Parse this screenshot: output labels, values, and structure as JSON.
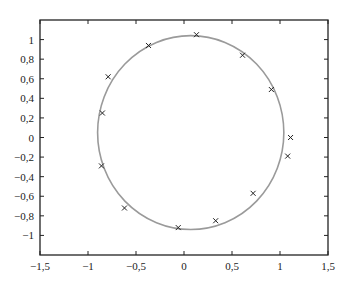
{
  "chart_data": {
    "type": "scatter",
    "title": "",
    "xlabel": "",
    "ylabel": "",
    "xlim": [
      -1.5,
      1.5
    ],
    "ylim": [
      -1.2,
      1.2
    ],
    "grid": false,
    "legend": null,
    "x_ticks": [
      -1.5,
      -1,
      -0.5,
      0,
      0.5,
      1,
      1.5
    ],
    "x_tick_labels": [
      "−1,5",
      "−1",
      "−0,5",
      "0",
      "0,5",
      "1",
      "1,5"
    ],
    "y_ticks": [
      -1,
      -0.8,
      -0.6,
      -0.4,
      -0.2,
      0,
      0.2,
      0.4,
      0.6,
      0.8,
      1
    ],
    "y_tick_labels": [
      "−1",
      "−0,8",
      "−0,6",
      "−0,4",
      "−0,2",
      "0",
      "0,2",
      "0,4",
      "0,6",
      "0,8",
      "1"
    ],
    "series": [
      {
        "name": "data points",
        "marker": "x",
        "color": "#222222",
        "points": [
          {
            "x": 0.13,
            "y": 1.05
          },
          {
            "x": 0.61,
            "y": 0.84
          },
          {
            "x": 0.91,
            "y": 0.49
          },
          {
            "x": 1.11,
            "y": 0.0
          },
          {
            "x": 1.08,
            "y": -0.19
          },
          {
            "x": 0.72,
            "y": -0.57
          },
          {
            "x": 0.33,
            "y": -0.85
          },
          {
            "x": -0.06,
            "y": -0.92
          },
          {
            "x": -0.62,
            "y": -0.72
          },
          {
            "x": -0.86,
            "y": -0.29
          },
          {
            "x": -0.85,
            "y": 0.25
          },
          {
            "x": -0.79,
            "y": 0.62
          },
          {
            "x": -0.37,
            "y": 0.94
          }
        ]
      },
      {
        "name": "fitted circle",
        "type": "circle",
        "color": "#9a9a9a",
        "center": {
          "x": 0.07,
          "y": 0.05
        },
        "radius_x": 0.97,
        "radius_y": 0.99
      }
    ]
  }
}
